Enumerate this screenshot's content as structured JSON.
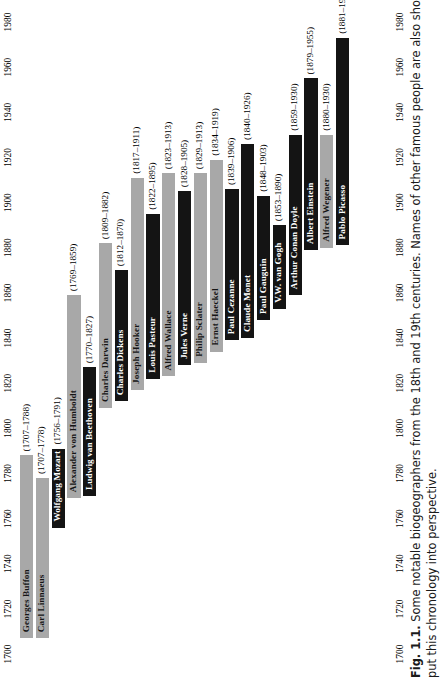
{
  "figure": {
    "number": "Fig. 1.1.",
    "caption_line1": "Some notable biogeographers from the 18th and 19th centuries. Names of other famous people are also shown to help to",
    "caption_line2": "put this chronology into perspective."
  },
  "colors": {
    "biogeographer_bar": "#a8a8a8",
    "other_famous_bar": "#141414",
    "background": "#ffffff",
    "text": "#000000"
  },
  "chart_data": {
    "type": "bar",
    "orientation": "vertical-timeline",
    "title": "Some notable biogeographers from the 18th and 19th centuries",
    "xlabel": "",
    "ylabel": "",
    "ylim": [
      1700,
      1990
    ],
    "grid": false,
    "legend": "none",
    "tick_labels": [
      "1700",
      "1720",
      "1740",
      "1760",
      "1780",
      "1800",
      "1820",
      "1840",
      "1860",
      "1880",
      "1900",
      "1920",
      "1940",
      "1960",
      "1980"
    ],
    "ticks": [
      1700,
      1720,
      1740,
      1760,
      1780,
      1800,
      1820,
      1840,
      1860,
      1880,
      1900,
      1920,
      1940,
      1960,
      1980
    ],
    "categories": [
      "Georges Buffon",
      "Carl Linnaeus",
      "Wolfgang Mozart",
      "Alexander von Humboldt",
      "Ludwig van Beethoven",
      "Charles Darwin",
      "Charles Dickens",
      "Joseph Hooker",
      "Louis Pasteur",
      "Alfred Wallace",
      "Jules Verne",
      "Philip Sclater",
      "Ernst Haeckel",
      "Paul Cezanne",
      "Claude Monet",
      "Paul Gauguin",
      "V.W. van Gogh",
      "Arthur Conan Doyle",
      "Albert Einstein",
      "Alfred Wegener",
      "Pablo Picasso"
    ],
    "bars": [
      {
        "name": "Georges Buffon",
        "years": "(1707–1788)",
        "birth": 1707,
        "death": 1788,
        "group": "biogeographer"
      },
      {
        "name": "Carl Linnaeus",
        "years": "(1707–1778)",
        "birth": 1707,
        "death": 1778,
        "group": "biogeographer"
      },
      {
        "name": "Wolfgang Mozart",
        "years": "(1756–1791)",
        "birth": 1756,
        "death": 1791,
        "group": "other"
      },
      {
        "name": "Alexander von Humboldt",
        "years": "(1769–1859)",
        "birth": 1769,
        "death": 1859,
        "group": "biogeographer"
      },
      {
        "name": "Ludwig van Beethoven",
        "years": "(1770–1827)",
        "birth": 1770,
        "death": 1827,
        "group": "other"
      },
      {
        "name": "Charles Darwin",
        "years": "(1809–1882)",
        "birth": 1809,
        "death": 1882,
        "group": "biogeographer"
      },
      {
        "name": "Charles Dickens",
        "years": "(1812–1870)",
        "birth": 1812,
        "death": 1870,
        "group": "other"
      },
      {
        "name": "Joseph Hooker",
        "years": "(1817–1911)",
        "birth": 1817,
        "death": 1911,
        "group": "biogeographer"
      },
      {
        "name": "Louis Pasteur",
        "years": "(1822–1895)",
        "birth": 1822,
        "death": 1895,
        "group": "other"
      },
      {
        "name": "Alfred Wallace",
        "years": "(1823–1913)",
        "birth": 1823,
        "death": 1913,
        "group": "biogeographer"
      },
      {
        "name": "Jules Verne",
        "years": "(1828–1905)",
        "birth": 1828,
        "death": 1905,
        "group": "other"
      },
      {
        "name": "Philip Sclater",
        "years": "(1829–1913)",
        "birth": 1829,
        "death": 1913,
        "group": "biogeographer"
      },
      {
        "name": "Ernst Haeckel",
        "years": "(1834–1919)",
        "birth": 1834,
        "death": 1919,
        "group": "biogeographer"
      },
      {
        "name": "Paul Cezanne",
        "years": "(1839–1906)",
        "birth": 1839,
        "death": 1906,
        "group": "other"
      },
      {
        "name": "Claude Monet",
        "years": "(1840–1926)",
        "birth": 1840,
        "death": 1926,
        "group": "other"
      },
      {
        "name": "Paul Gauguin",
        "years": "(1848–1903)",
        "birth": 1848,
        "death": 1903,
        "group": "other"
      },
      {
        "name": "V.W. van Gogh",
        "years": "(1853–1890)",
        "birth": 1853,
        "death": 1890,
        "group": "other"
      },
      {
        "name": "Arthur Conan Doyle",
        "years": "(1859–1930)",
        "birth": 1859,
        "death": 1930,
        "group": "other"
      },
      {
        "name": "Albert Einstein",
        "years": "(1879–1955)",
        "birth": 1879,
        "death": 1955,
        "group": "other"
      },
      {
        "name": "Alfred Wegener",
        "years": "(1880–1930)",
        "birth": 1880,
        "death": 1930,
        "group": "biogeographer"
      },
      {
        "name": "Pablo Picasso",
        "years": "(1881–1973)",
        "birth": 1881,
        "death": 1973,
        "group": "other"
      }
    ]
  }
}
